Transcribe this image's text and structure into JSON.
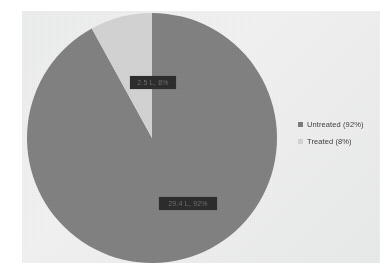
{
  "chart_data": {
    "type": "pie",
    "title": "",
    "categories": [
      "Untreated",
      "Treated"
    ],
    "values": [
      92,
      8
    ],
    "unit": "%",
    "legend_position": "right",
    "grid": false,
    "slices": [
      {
        "name": "Untreated",
        "percent": 92,
        "color": "#808080",
        "legend_label": "Untreated (92%)",
        "data_label": "29.4 L, 92%"
      },
      {
        "name": "Treated",
        "percent": 8,
        "color": "#d2d2d2",
        "legend_label": "Treated (8%)",
        "data_label": "2.5 L, 8%"
      }
    ],
    "start_angle_deg": 0,
    "direction": "counterclockwise"
  },
  "legend": {
    "items": [
      {
        "label": "Untreated (92%)",
        "color": "#7a7a7a"
      },
      {
        "label": "Treated (8%)",
        "color": "#d2d2d2"
      }
    ]
  },
  "labels": {
    "treated": "2.5 L, 8%",
    "untreated": "29.4 L, 92%"
  },
  "colors": {
    "untreated_slice": "#808080",
    "treated_slice": "#d2d2d2",
    "plot_background": "#f0f0f0",
    "page_background": "#ffffff",
    "label_box": "#2a2a2a",
    "legend_text": "#3b3b3b"
  }
}
